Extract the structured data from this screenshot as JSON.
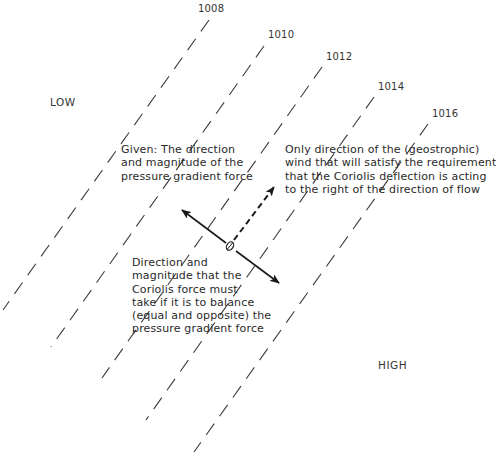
{
  "regions": {
    "low": "LOW",
    "high": "HIGH"
  },
  "isobars": [
    {
      "label": "1008",
      "x1": 209,
      "y1": 20,
      "x2": 3,
      "y2": 310,
      "label_x": 198,
      "label_y": 3
    },
    {
      "label": "1010",
      "x1": 264,
      "y1": 46,
      "x2": 51,
      "y2": 347,
      "label_x": 268,
      "label_y": 29
    },
    {
      "label": "1012",
      "x1": 322,
      "y1": 67,
      "x2": 102,
      "y2": 378,
      "label_x": 326,
      "label_y": 51
    },
    {
      "label": "1014",
      "x1": 374,
      "y1": 97,
      "x2": 146,
      "y2": 420,
      "label_x": 378,
      "label_y": 81
    },
    {
      "label": "1016",
      "x1": 428,
      "y1": 124,
      "x2": 194,
      "y2": 452,
      "label_x": 432,
      "label_y": 108
    }
  ],
  "parcel": {
    "cx": 230,
    "cy": 246
  },
  "vectors": {
    "pressure_gradient_force": {
      "x1": 226,
      "y1": 243,
      "x2": 182,
      "y2": 210
    },
    "coriolis_force": {
      "x1": 236,
      "y1": 251,
      "x2": 279,
      "y2": 283
    },
    "geostrophic_wind": {
      "x1": 234,
      "y1": 240,
      "x2": 274,
      "y2": 187
    }
  },
  "annotations": {
    "pgf_note": "Given: The direction\nand magnitude of the\npressure gradient force",
    "wind_note": "Only direction of the (geostrophic)\nwind that will satisfy the requirement\nthat the Coriolis deflection is acting\nto the right of the direction of flow",
    "coriolis_note": "Direction and\nmagnitude that the\nCoriolis force must\ntake if it is to balance\n(equal and opposite) the\npressure gradient force"
  }
}
